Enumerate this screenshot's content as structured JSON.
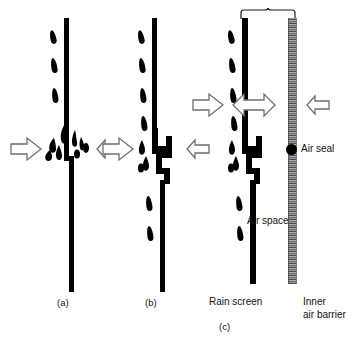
{
  "figure": {
    "background_color": "#ffffff",
    "ink_color": "#000000",
    "barrier_color": "#7a7a7a"
  },
  "panels": [
    {
      "key": "a",
      "caption": "(a)",
      "description": "Open joint rain screen with water entering",
      "joint_type": "open-butt-joint"
    },
    {
      "key": "b",
      "caption": "(b)",
      "description": "Labyrinth baffled joint rain screen",
      "joint_type": "labyrinth-joint"
    },
    {
      "key": "c",
      "caption": "(c)",
      "description": "Pressure equalised rain screen with air space and inner air barrier",
      "joint_type": "labyrinth-joint"
    }
  ],
  "labels": {
    "air_seal": "Air seal",
    "air_space": "Air space",
    "rain_screen": "Rain screen",
    "inner_air_barrier_line1": "Inner",
    "inner_air_barrier_line2": "air barrier"
  },
  "icons": {
    "arrow_right": "arrow-right-icon",
    "arrow_left": "arrow-left-icon",
    "arrow_double": "arrow-double-horizontal-icon",
    "water_drop": "water-drop-icon",
    "air_seal_dot": "air-seal-dot-icon",
    "brace": "curly-brace-icon"
  }
}
